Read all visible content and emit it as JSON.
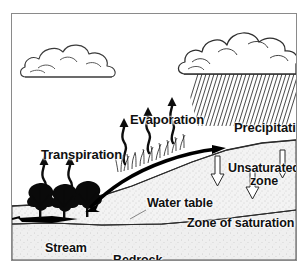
{
  "figure": {
    "title_fragment": "",
    "frame_color": "#8a8a8a",
    "background": "#ffffff",
    "ink": "#101010"
  },
  "labels": {
    "evaporation": "Evaporation",
    "transpiration": "Transpiration",
    "precipitation": "Precipitation",
    "unsaturated_zone_line1": "Unsaturated",
    "unsaturated_zone_line2": "zone",
    "water_table": "Water table",
    "zone_of_saturation": "Zone of saturation",
    "stream": "Stream",
    "bedrock": "Bedrock"
  },
  "diagram_elements": {
    "clouds": [
      {
        "name": "fair-weather-cumulus-cloud",
        "position": "upper-left",
        "raining": false
      },
      {
        "name": "rain-cloud",
        "position": "upper-right",
        "raining": true
      }
    ],
    "rain": {
      "style": "diagonal-hatch-streaks",
      "direction": "down-left",
      "color": "#222222"
    },
    "arrows": [
      {
        "name": "evaporation-arrow",
        "count": 3,
        "style": "wavy-solid-up",
        "color": "#0d0d0d"
      },
      {
        "name": "transpiration-arrow",
        "count": 2,
        "style": "wavy-solid-up",
        "color": "#0d0d0d"
      },
      {
        "name": "infiltration-arrow",
        "count": 3,
        "style": "hollow-outline-down",
        "color": "#ffffff"
      },
      {
        "name": "groundwater-flow-arrow",
        "count": 1,
        "style": "thick-curved-down-left",
        "color": "#000000"
      }
    ],
    "vegetation": {
      "name": "tree",
      "count": 3,
      "location": "left-bank",
      "color": "#0a0a0a"
    },
    "grass": {
      "name": "grass-tufts",
      "location": "hillside-crest"
    },
    "layers": [
      {
        "name": "unsaturated-zone",
        "fill": "light-stipple",
        "color": "#e6e6e6"
      },
      {
        "name": "zone-of-saturation",
        "fill": "dense-speckle",
        "color": "#d2d2d2"
      },
      {
        "name": "bedrock",
        "fill": "fine-stipple",
        "color": "#e2e2e2"
      }
    ],
    "water_bodies": [
      {
        "name": "stream-pool",
        "color": "#000000",
        "location": "left"
      }
    ]
  }
}
